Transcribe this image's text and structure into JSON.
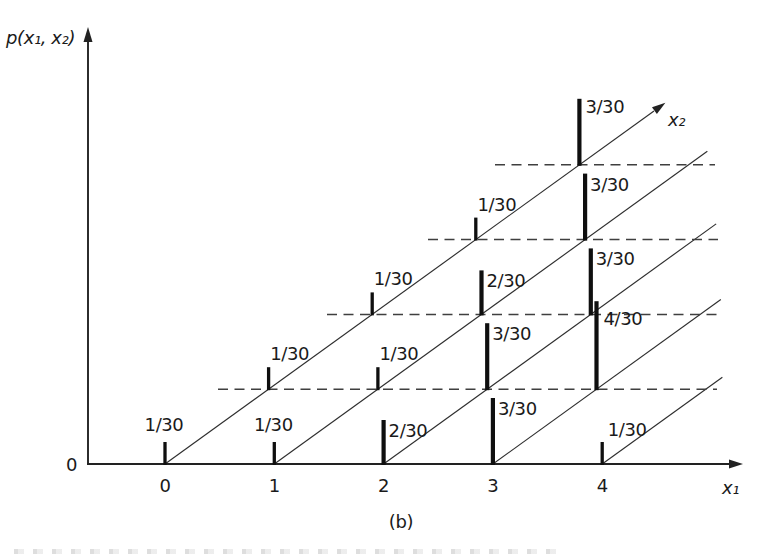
{
  "figure": {
    "caption": "(b)",
    "axes": {
      "vertical_label": "p(x₁, x₂)",
      "x1_label": "x₁",
      "x2_label": "x₂",
      "origin_label": "0"
    },
    "chart_data": {
      "type": "bar",
      "subtype": "3d-oblique-stem-plot",
      "title": "",
      "x1_axis": {
        "label": "x₁",
        "ticks": [
          "0",
          "1",
          "2",
          "3",
          "4"
        ]
      },
      "x2_axis": {
        "label": "x₂",
        "levels_marked_by_dashed_lines": [
          1,
          2,
          3,
          4
        ]
      },
      "value_axis": {
        "label": "p(x₁, x₂)",
        "unit_fraction": "1/30",
        "max_value_shown": "4/30"
      },
      "denominator": 30,
      "points": [
        {
          "x1": 0,
          "x2": 0,
          "value": 1,
          "label": "1/30"
        },
        {
          "x1": 1,
          "x2": 0,
          "value": 1,
          "label": "1/30"
        },
        {
          "x1": 2,
          "x2": 0,
          "value": 2,
          "label": "2/30"
        },
        {
          "x1": 3,
          "x2": 0,
          "value": 3,
          "label": "3/30"
        },
        {
          "x1": 4,
          "x2": 0,
          "value": 1,
          "label": "1/30"
        },
        {
          "x1": 0,
          "x2": 1,
          "value": 1,
          "label": "1/30"
        },
        {
          "x1": 1,
          "x2": 1,
          "value": 1,
          "label": "1/30"
        },
        {
          "x1": 2,
          "x2": 1,
          "value": 3,
          "label": "3/30"
        },
        {
          "x1": 3,
          "x2": 1,
          "value": 4,
          "label": "4/30"
        },
        {
          "x1": 0,
          "x2": 2,
          "value": 1,
          "label": "1/30"
        },
        {
          "x1": 1,
          "x2": 2,
          "value": 2,
          "label": "2/30"
        },
        {
          "x1": 2,
          "x2": 2,
          "value": 3,
          "label": "3/30"
        },
        {
          "x1": 0,
          "x2": 3,
          "value": 1,
          "label": "1/30"
        },
        {
          "x1": 1,
          "x2": 3,
          "value": 3,
          "label": "3/30"
        },
        {
          "x1": 0,
          "x2": 4,
          "value": 3,
          "label": "3/30"
        }
      ],
      "grid": {
        "x2_direction_lines_from_each_x1_tick": true,
        "dashed_horizontal_lines_at_x2_levels": true
      },
      "colors": {
        "ink": "#1a1a1a",
        "dash": "#3f3f3f",
        "background": "#ffffff"
      }
    }
  }
}
